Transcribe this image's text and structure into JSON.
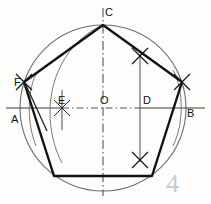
{
  "figure": {
    "exercise_number": "4",
    "colors": {
      "background": "#fdfdfb",
      "pencil_dark": "#141414",
      "pencil_light": "#6b6b6b",
      "centerline": "#555555",
      "faint_number": "#c9c9cc"
    },
    "circle": {
      "center_label": "O",
      "center_x": 103,
      "center_y": 108,
      "radius": 83
    },
    "labels": [
      {
        "name": "point-c",
        "text": "C",
        "x": 105,
        "y": 16
      },
      {
        "name": "point-f",
        "text": "F",
        "x": 18,
        "y": 84
      },
      {
        "name": "point-a",
        "text": "A",
        "x": 13,
        "y": 121
      },
      {
        "name": "point-e",
        "text": "E",
        "x": 58,
        "y": 104
      },
      {
        "name": "point-o",
        "text": "O",
        "x": 101,
        "y": 104
      },
      {
        "name": "point-d",
        "text": "D",
        "x": 144,
        "y": 104
      },
      {
        "name": "point-b",
        "text": "B",
        "x": 188,
        "y": 114
      }
    ],
    "pentagon": {
      "name": "inscribed-pentagon",
      "vertices": [
        {
          "label": "C",
          "x": 103,
          "y": 25
        },
        {
          "label": "",
          "x": 182,
          "y": 82
        },
        {
          "label": "",
          "x": 152,
          "y": 176
        },
        {
          "label": "",
          "x": 54,
          "y": 176
        },
        {
          "label": "F",
          "x": 24,
          "y": 82
        }
      ]
    },
    "axes": {
      "horizontal_label": "A-B diameter",
      "vertical_label": "C-O centerline",
      "horizontal_y": 108,
      "vertical_x": 103
    },
    "construction": {
      "d_line_label": "vertical through D",
      "d_x": 140,
      "e_x": 62,
      "cross_marks": [
        {
          "name": "cross-mark-upper",
          "x": 140,
          "y": 56
        },
        {
          "name": "cross-mark-lower",
          "x": 140,
          "y": 160
        },
        {
          "name": "cross-mark-f",
          "x": 24,
          "y": 82
        },
        {
          "name": "cross-mark-right",
          "x": 182,
          "y": 82
        },
        {
          "name": "cross-mark-e",
          "x": 62,
          "y": 108
        }
      ]
    }
  }
}
